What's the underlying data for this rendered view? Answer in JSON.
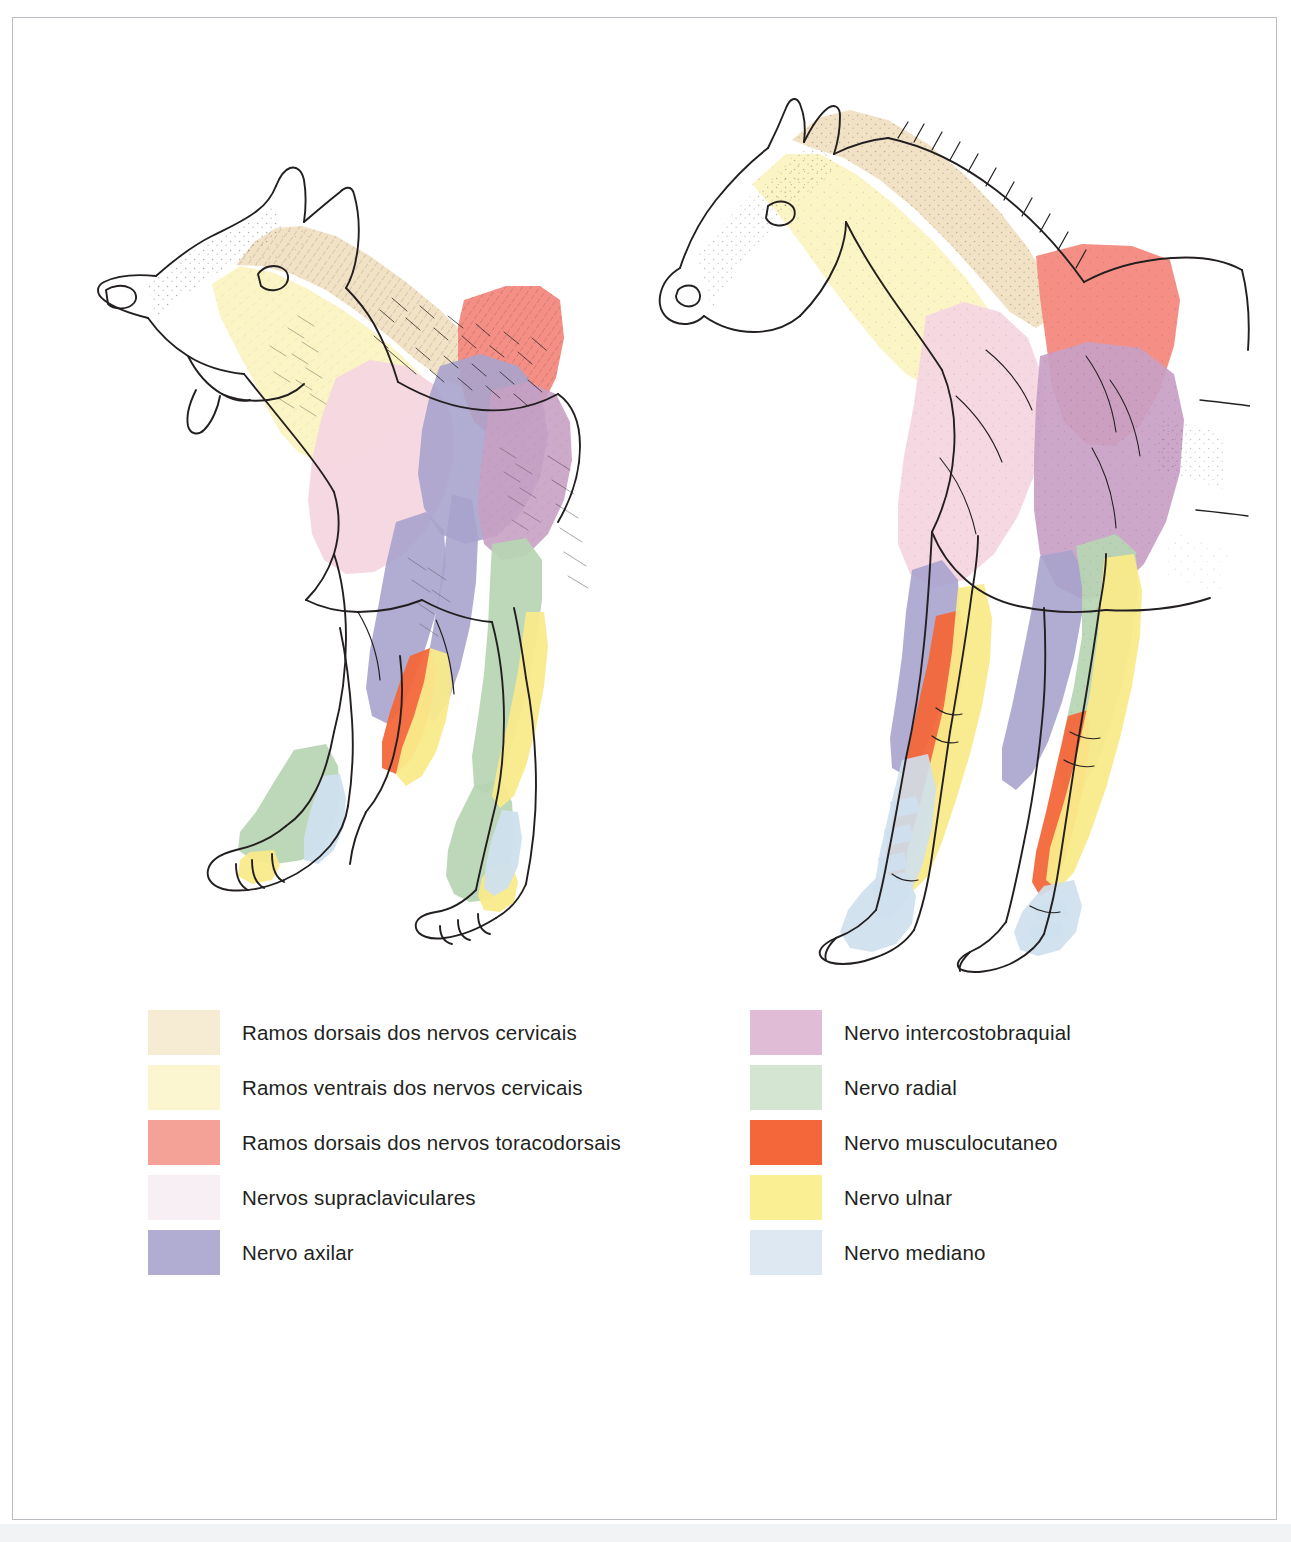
{
  "figure": {
    "type": "anatomical-illustration",
    "animals": [
      {
        "name": "dog",
        "label": "Cao",
        "view": "lateral"
      },
      {
        "name": "horse",
        "label": "Cavalo",
        "view": "lateral"
      }
    ]
  },
  "legend": {
    "left_column": [
      {
        "label": "Ramos dorsais dos nervos cervicais",
        "color": "#f6ecd3",
        "key": "ramos-dorsais-cervicais"
      },
      {
        "label": "Ramos ventrais dos nervos cervicais",
        "color": "#fbf6cf",
        "key": "ramos-ventrais-cervicais"
      },
      {
        "label": "Ramos dorsais dos nervos toracodorsais",
        "color": "#f4a197",
        "key": "ramos-dorsais-toracodorsais"
      },
      {
        "label": "Nervos supraclaviculares",
        "color": "#f8eff4",
        "key": "nervos-supraclaviculares"
      },
      {
        "label": "Nervo axilar",
        "color": "#b1add2",
        "key": "nervo-axilar"
      }
    ],
    "right_column": [
      {
        "label": "Nervo intercostobraquial",
        "color": "#e1bcd7",
        "key": "nervo-intercostobraquial"
      },
      {
        "label": "Nervo radial",
        "color": "#d4e6d1",
        "key": "nervo-radial"
      },
      {
        "label": "Nervo musculocutaneo",
        "color": "#f4673a",
        "key": "nervo-musculocutaneo"
      },
      {
        "label": "Nervo ulnar",
        "color": "#faef93",
        "key": "nervo-ulnar"
      },
      {
        "label": "Nervo mediano",
        "color": "#dde8f2",
        "key": "nervo-mediano"
      }
    ]
  },
  "colors": {
    "ramos_dorsais_cervicais": "#f0dfc0",
    "ramos_ventrais_cervicais": "#fbf3c2",
    "ramos_dorsais_toracodorsais": "#f4897f",
    "nervos_supraclaviculares": "#f6d6e2",
    "nervo_axilar": "#a8a3cc",
    "nervo_intercostobraquial": "#c8a0c4",
    "nervo_radial": "#b7d5b2",
    "nervo_musculocutaneo": "#f4673a",
    "nervo_ulnar": "#f9ea8a",
    "nervo_mediano": "#cfe0ee",
    "ink": "#231f20",
    "frame": "#b9bcc0",
    "page": "#ffffff"
  }
}
